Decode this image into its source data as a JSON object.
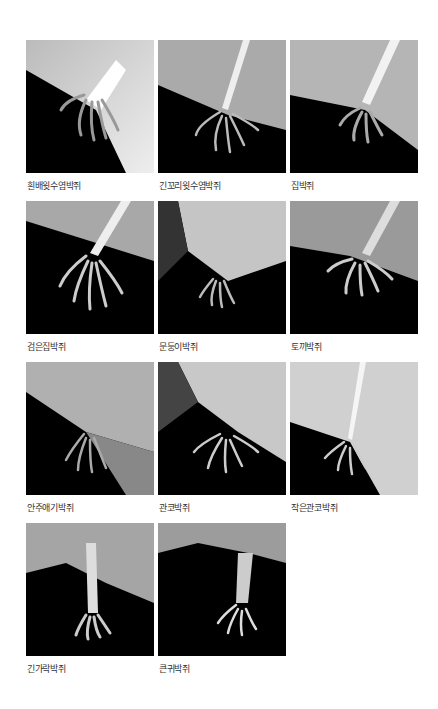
{
  "figure": {
    "rows": [
      [
        {
          "caption": "흰배윗수염박쥐",
          "photo": "bat-hindfoot-photo"
        },
        {
          "caption": "긴꼬리윗수염박쥐",
          "photo": "bat-hindfoot-photo"
        },
        {
          "caption": "집박쥐",
          "photo": "bat-hindfoot-photo"
        }
      ],
      [
        {
          "caption": "검은집박쥐",
          "photo": "bat-hindfoot-photo"
        },
        {
          "caption": "문둥이박쥐",
          "photo": "bat-hindfoot-photo"
        },
        {
          "caption": "토끼박쥐",
          "photo": "bat-hindfoot-photo"
        }
      ],
      [
        {
          "caption": "안주애기박쥐",
          "photo": "bat-hindfoot-photo"
        },
        {
          "caption": "관코박쥐",
          "photo": "bat-hindfoot-photo"
        },
        {
          "caption": "작은관코박쥐",
          "photo": "bat-hindfoot-photo"
        }
      ],
      [
        {
          "caption": "긴가락박쥐",
          "photo": "bat-hindfoot-photo"
        },
        {
          "caption": "큰귀박쥐",
          "photo": "bat-hindfoot-photo"
        }
      ]
    ]
  }
}
